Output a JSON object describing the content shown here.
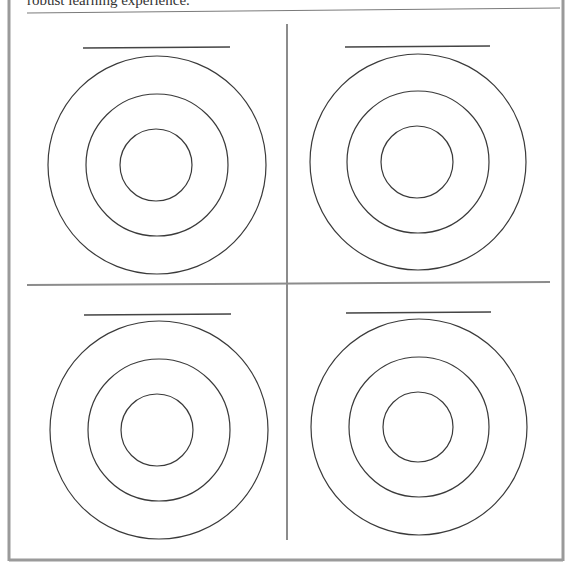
{
  "document": {
    "top_text": "robust learning experience.",
    "colors": {
      "border": "#9a9a9a",
      "divider": "#8c8c8c",
      "ring": "#3a3a3a",
      "name_line": "#444444",
      "top_rule": "#7a7a7a"
    }
  },
  "worksheet": {
    "quadrant_count": 4,
    "targets": [
      {
        "position": "top-left",
        "name_line": "",
        "rings": 3
      },
      {
        "position": "top-right",
        "name_line": "",
        "rings": 3
      },
      {
        "position": "bottom-left",
        "name_line": "",
        "rings": 3
      },
      {
        "position": "bottom-right",
        "name_line": "",
        "rings": 3
      }
    ]
  }
}
